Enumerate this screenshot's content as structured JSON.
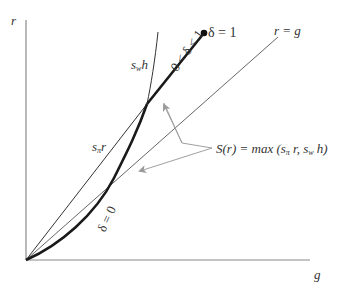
{
  "diagram": {
    "axes": {
      "y_label": "r",
      "x_label": "g"
    },
    "curves": {
      "r_eq_g_label": "r = g",
      "s_pi_r_label_main": "s",
      "s_pi_r_label_sub": "π",
      "s_pi_r_label_var": "r",
      "s_w_h_label_main": "s",
      "s_w_h_label_sub": "w",
      "s_w_h_label_var": "h",
      "delta_zero_label": "δ = 0",
      "delta_between_label": "0 < δ < 1",
      "delta_one_label": "δ = 1"
    },
    "annotation": {
      "savings_function_label": "S(r) = max (s",
      "savings_sub_pi": "π",
      "savings_mid": " r, s",
      "savings_sub_w": "w",
      "savings_end": " h)"
    },
    "colors": {
      "axis": "#808080",
      "thin_line": "#3a3a3a",
      "thick_line": "#1a1a1a",
      "arrow": "#a0a0a0"
    }
  }
}
